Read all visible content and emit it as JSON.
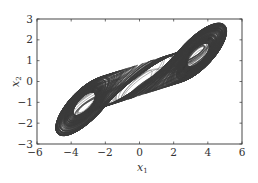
{
  "chart_data": {
    "type": "line",
    "title": "",
    "xlabel": "x1",
    "ylabel": "x2",
    "xlim": [
      -6,
      6
    ],
    "ylim": [
      -3,
      3
    ],
    "xticks": [
      -6,
      -4,
      -2,
      0,
      2,
      4,
      6
    ],
    "yticks": [
      -3,
      -2,
      -1,
      0,
      1,
      2,
      3
    ],
    "grid": false,
    "legend": null,
    "series": [
      {
        "name": "trajectory",
        "color": "#3a3a3a",
        "extent": {
          "x_min": -4.9,
          "x_max": 5.1,
          "y_min": -2.6,
          "y_max": 2.8
        },
        "key_points": [
          {
            "label": "left scroll tip",
            "x": -4.8,
            "y": 0.8
          },
          {
            "label": "right scroll tip",
            "x": 5.0,
            "y": -0.7
          },
          {
            "label": "central focus",
            "x": 0.0,
            "y": 0.0
          },
          {
            "label": "dense band upper",
            "x": -1.0,
            "y": 1.1
          },
          {
            "label": "dense band lower",
            "x": 1.0,
            "y": -1.1
          }
        ]
      }
    ]
  },
  "axes": {
    "xlabel_main": "x",
    "xlabel_sub": "1",
    "ylabel_main": "x",
    "ylabel_sub": "2",
    "xtick_labels": [
      "−6",
      "−4",
      "−2",
      "0",
      "2",
      "4",
      "6"
    ],
    "ytick_labels": [
      "−3",
      "−2",
      "−1",
      "0",
      "1",
      "2",
      "3"
    ]
  },
  "colors": {
    "axis": "#333333",
    "trajectory": "#3a3a3a",
    "background": "#ffffff"
  }
}
